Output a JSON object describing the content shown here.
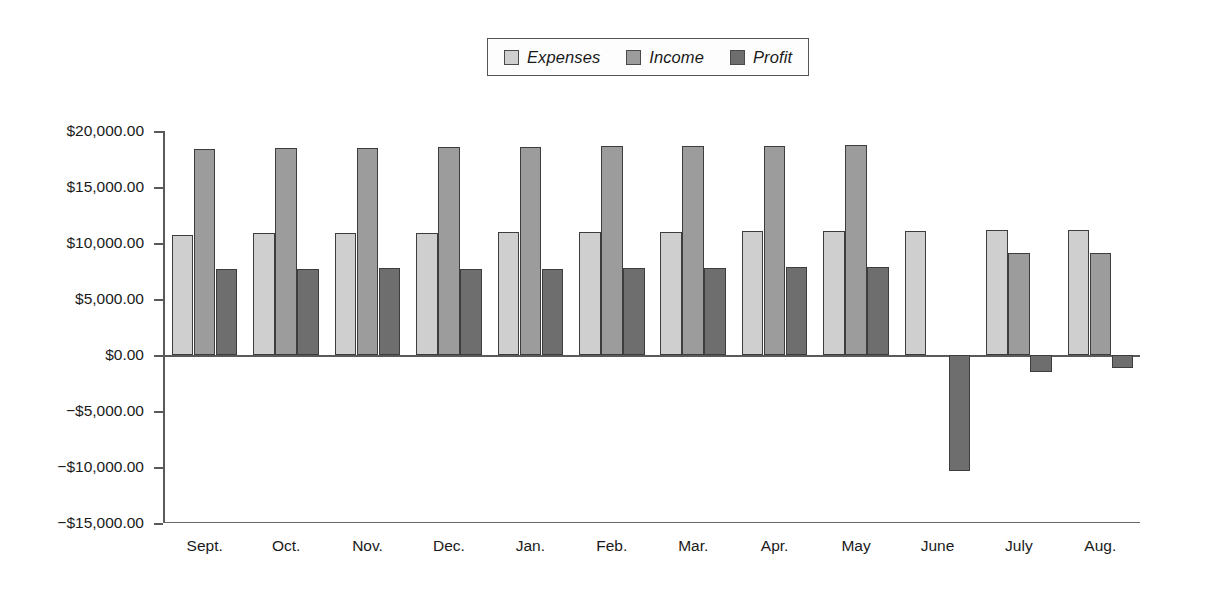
{
  "chart_data": {
    "type": "bar",
    "title": "",
    "subtitle": "",
    "xlabel": "",
    "ylabel": "",
    "grid": false,
    "legend_position": "top-center",
    "ylim": [
      -15000,
      20000
    ],
    "yticks": [
      20000,
      15000,
      10000,
      5000,
      0,
      -5000,
      -10000,
      -15000
    ],
    "ytick_labels": [
      "$20,000.00",
      "$15,000.00",
      "$10,000.00",
      "$5,000.00",
      "$0.00",
      "−$5,000.00",
      "−$10,000.00",
      "−$15,000.00"
    ],
    "categories": [
      "Sept.",
      "Oct.",
      "Nov.",
      "Dec.",
      "Jan.",
      "Feb.",
      "Mar.",
      "Apr.",
      "May",
      "June",
      "July",
      "Aug."
    ],
    "series": [
      {
        "name": "Expenses",
        "color": "#cfcfcf",
        "values": [
          10750,
          10900,
          10850,
          10900,
          10950,
          11000,
          11000,
          11050,
          11100,
          11100,
          11150,
          11200
        ]
      },
      {
        "name": "Income",
        "color": "#9c9c9c",
        "values": [
          18400,
          18500,
          18500,
          18550,
          18600,
          18620,
          18650,
          18700,
          18750,
          null,
          9100,
          9150
        ]
      },
      {
        "name": "Profit",
        "color": "#6e6e6e",
        "values": [
          7650,
          7700,
          7750,
          7700,
          7720,
          7730,
          7780,
          7820,
          7880,
          -10350,
          -1500,
          -1200
        ]
      }
    ]
  },
  "legend": {
    "entries": [
      {
        "label": "Expenses",
        "color": "#cfcfcf"
      },
      {
        "label": "Income",
        "color": "#9c9c9c"
      },
      {
        "label": "Profit",
        "color": "#6e6e6e"
      }
    ]
  },
  "colors": {
    "expenses": "#cfcfcf",
    "income": "#9c9c9c",
    "profit": "#6e6e6e",
    "axis": "#5a5a5a",
    "bar_outline": "#3d3d3d",
    "text": "#1a1a1a",
    "background": "#ffffff"
  }
}
